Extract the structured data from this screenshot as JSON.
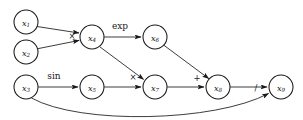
{
  "diagram": {
    "type": "directed-acyclic-graph",
    "background_color": "#ffffff",
    "stroke_color": "#1a1a1a",
    "node_fill": "#ffffff",
    "node_radius": 12,
    "nodes": [
      {
        "id": "x1",
        "base": "x",
        "subscript": "1",
        "cx": 26,
        "cy": 22
      },
      {
        "id": "x2",
        "base": "x",
        "subscript": "2",
        "cx": 26,
        "cy": 52
      },
      {
        "id": "x3",
        "base": "x",
        "subscript": "3",
        "cx": 26,
        "cy": 87
      },
      {
        "id": "x4",
        "base": "x",
        "subscript": "4",
        "cx": 92,
        "cy": 37
      },
      {
        "id": "x5",
        "base": "x",
        "subscript": "5",
        "cx": 92,
        "cy": 87
      },
      {
        "id": "x6",
        "base": "x",
        "subscript": "6",
        "cx": 155,
        "cy": 37
      },
      {
        "id": "x7",
        "base": "x",
        "subscript": "7",
        "cx": 155,
        "cy": 87
      },
      {
        "id": "x8",
        "base": "x",
        "subscript": "8",
        "cx": 218,
        "cy": 87
      },
      {
        "id": "x9",
        "base": "x",
        "subscript": "9",
        "cx": 281,
        "cy": 87
      }
    ],
    "edges": [
      {
        "id": "e-x1-x4",
        "from": "x1",
        "to": "x4",
        "label": "",
        "label_x": 0,
        "label_y": 0
      },
      {
        "id": "e-x2-x4",
        "from": "x2",
        "to": "x4",
        "label": "×",
        "label_x": 72,
        "label_y": 36
      },
      {
        "id": "e-x4-x6",
        "from": "x4",
        "to": "x6",
        "label": "exp",
        "label_x": 120,
        "label_y": 26
      },
      {
        "id": "e-x4-x7",
        "from": "x4",
        "to": "x7",
        "label": "",
        "label_x": 0,
        "label_y": 0
      },
      {
        "id": "e-x3-x5",
        "from": "x3",
        "to": "x5",
        "label": "sin",
        "label_x": 54,
        "label_y": 76
      },
      {
        "id": "e-x5-x7",
        "from": "x5",
        "to": "x7",
        "label": "×",
        "label_x": 133,
        "label_y": 77
      },
      {
        "id": "e-x6-x8",
        "from": "x6",
        "to": "x8",
        "label": "",
        "label_x": 0,
        "label_y": 0
      },
      {
        "id": "e-x7-x8",
        "from": "x7",
        "to": "x8",
        "label": "+",
        "label_x": 197,
        "label_y": 78
      },
      {
        "id": "e-x8-x9",
        "from": "x8",
        "to": "x9",
        "label": "",
        "label_x": 0,
        "label_y": 0
      },
      {
        "id": "e-x3-x9",
        "from": "x3",
        "to": "x9",
        "label": "/",
        "label_x": 256,
        "label_y": 88,
        "curved": true
      }
    ]
  }
}
